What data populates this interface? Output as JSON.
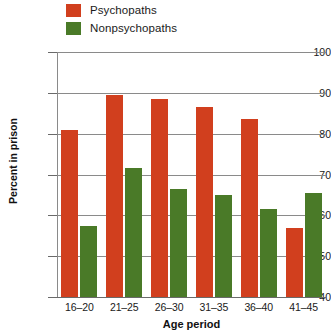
{
  "legend": {
    "position": "top-left",
    "items": [
      {
        "label": "Psychopaths",
        "color": "#d13f1e",
        "swatch_name": "legend-swatch-psychopaths"
      },
      {
        "label": "Nonpsychopaths",
        "color": "#4a7a28",
        "swatch_name": "legend-swatch-nonpsychopaths"
      }
    ]
  },
  "axes": {
    "y_title": "Percent in prison",
    "x_title": "Age period",
    "y_ticks": [
      "100",
      "90",
      "80",
      "70",
      "60",
      "50",
      "40"
    ],
    "x_ticks": [
      "16–20",
      "21–25",
      "26–30",
      "31–35",
      "36–40",
      "41–45"
    ]
  },
  "colors": {
    "psychopaths": "#d13f1e",
    "nonpsychopaths": "#4a7a28",
    "gridline": "#8a8a8a",
    "text": "#1a1a1a",
    "background": "#ffffff"
  },
  "chart_data": {
    "type": "bar",
    "title": "",
    "subtitle": "",
    "xlabel": "Age period",
    "ylabel": "Percent in prison",
    "categories": [
      "16–20",
      "21–25",
      "26–30",
      "31–35",
      "36–40",
      "41–45"
    ],
    "series": [
      {
        "name": "Psychopaths",
        "color": "#d13f1e",
        "values": [
          81,
          89.5,
          88.5,
          86.5,
          83.5,
          57
        ]
      },
      {
        "name": "Nonpsychopaths",
        "color": "#4a7a28",
        "values": [
          57.5,
          71.5,
          66.5,
          65,
          61.5,
          65.5
        ]
      }
    ],
    "ylim": [
      40,
      100
    ],
    "ytick_values": [
      40,
      50,
      60,
      70,
      80,
      90,
      100
    ],
    "grid": true,
    "grid_axis": "y",
    "legend_position": "top-left",
    "bar_group_order": [
      "Psychopaths",
      "Nonpsychopaths"
    ]
  }
}
